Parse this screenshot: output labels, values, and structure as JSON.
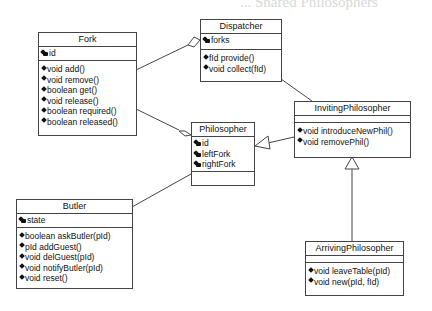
{
  "page_header": "... Shared Philosophers",
  "classes": {
    "fork": {
      "name": "Fork",
      "attributes": [
        "id"
      ],
      "operations": [
        "void add()",
        "void remove()",
        "boolean get()",
        "void release()",
        "boolean required()",
        "boolean released()"
      ]
    },
    "dispatcher": {
      "name": "Dispatcher",
      "attributes": [
        "forks"
      ],
      "operations": [
        "fId provide()",
        "void collect(fId)"
      ]
    },
    "philosopher": {
      "name": "Philosopher",
      "attributes": [
        "id",
        "leftFork",
        "rightFork"
      ],
      "operations": []
    },
    "inviting_philosopher": {
      "name": "InvitingPhilosopher",
      "attributes": [],
      "operations": [
        "void introduceNewPhil()",
        "void removePhil()"
      ]
    },
    "butler": {
      "name": "Butler",
      "attributes": [
        "state"
      ],
      "operations": [
        "boolean askButler(pId)",
        "pId addGuest()",
        "void delGuest(pId)",
        "void notifyButler(pId)",
        "void reset()"
      ]
    },
    "arriving_philosopher": {
      "name": "ArrivingPhilosopher",
      "attributes": [],
      "operations": [
        "void leaveTable(pId)",
        "void new(pId, fId)"
      ]
    }
  },
  "relationships": [
    {
      "from": "Fork",
      "to": "Dispatcher",
      "type": "aggregation"
    },
    {
      "from": "Fork",
      "to": "Philosopher",
      "type": "aggregation"
    },
    {
      "from": "Dispatcher",
      "to": "InvitingPhilosopher",
      "type": "association"
    },
    {
      "from": "InvitingPhilosopher",
      "to": "Philosopher",
      "type": "generalization"
    },
    {
      "from": "Butler",
      "to": "Philosopher",
      "type": "association"
    },
    {
      "from": "ArrivingPhilosopher",
      "to": "InvitingPhilosopher",
      "type": "generalization"
    }
  ]
}
